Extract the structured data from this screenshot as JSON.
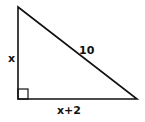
{
  "diagram": {
    "type": "right-triangle",
    "labels": {
      "vertical_leg": "x",
      "hypotenuse": "10",
      "horizontal_leg": "x+2"
    },
    "colors": {
      "stroke": "#111111",
      "background": "#ffffff"
    },
    "right_angle_marker": true
  }
}
